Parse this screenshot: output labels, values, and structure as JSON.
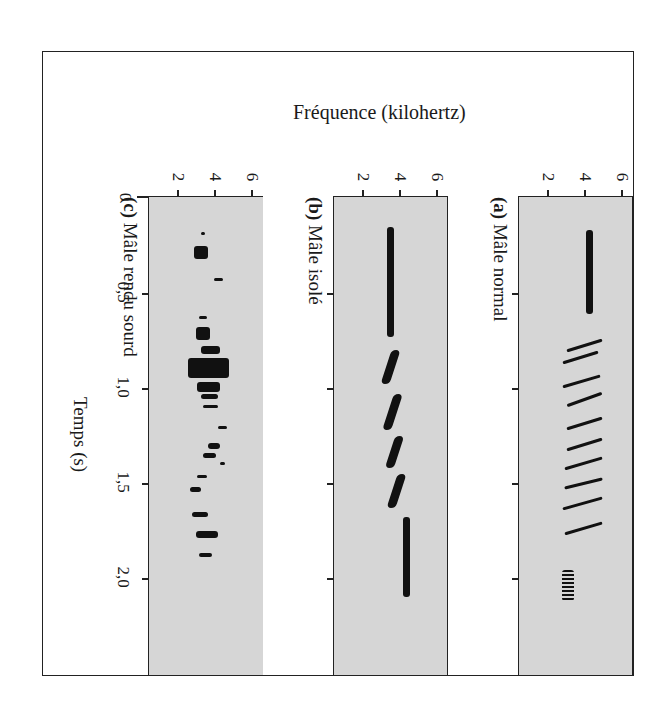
{
  "figure": {
    "frequency_label": "Fréquence (kilohertz)",
    "time_label": "Temps (s)",
    "panel_background": "#d6d6d6",
    "mark_color": "#111111"
  },
  "chart_data": {
    "type": "heatmap",
    "subtype": "spectrogram (rotated 90° clockwise: time runs downward, frequency runs rightward)",
    "title": "",
    "xlabel": "Temps (s)",
    "ylabel": "Fréquence (kilohertz)",
    "time_ticks": [
      "0",
      "0,5",
      "1,0",
      "1,5",
      "2,0"
    ],
    "time_tick_values": [
      0,
      0.5,
      1.0,
      1.5,
      2.0
    ],
    "frequency_ticks": [
      "2",
      "4",
      "6"
    ],
    "frequency_tick_values": [
      2,
      4,
      6
    ],
    "xlim": [
      0,
      2.5
    ],
    "ylim": [
      0,
      7
    ],
    "grid": false,
    "panels": [
      {
        "id": "c",
        "label_letter": "(c)",
        "label_text": "Mâle rendu sourd",
        "description": "Scattered, irregular fragments around 3–4 kHz with no coherent structure",
        "segments": [
          {
            "t0": 0.18,
            "t1": 0.19,
            "f0": 3.3,
            "f1": 3.5
          },
          {
            "t0": 0.25,
            "t1": 0.32,
            "f0": 2.9,
            "f1": 3.7
          },
          {
            "t0": 0.42,
            "t1": 0.43,
            "f0": 4.0,
            "f1": 4.5
          },
          {
            "t0": 0.62,
            "t1": 0.63,
            "f0": 3.2,
            "f1": 3.6
          },
          {
            "t0": 0.68,
            "t1": 0.75,
            "f0": 3.0,
            "f1": 3.8
          },
          {
            "t0": 0.78,
            "t1": 0.82,
            "f0": 3.3,
            "f1": 4.3
          },
          {
            "t0": 0.84,
            "t1": 0.95,
            "f0": 2.6,
            "f1": 4.8
          },
          {
            "t0": 0.97,
            "t1": 1.02,
            "f0": 3.1,
            "f1": 4.3
          },
          {
            "t0": 1.03,
            "t1": 1.06,
            "f0": 3.3,
            "f1": 4.2
          },
          {
            "t0": 1.09,
            "t1": 1.1,
            "f0": 3.4,
            "f1": 4.2
          },
          {
            "t0": 1.2,
            "t1": 1.21,
            "f0": 4.2,
            "f1": 4.7
          },
          {
            "t0": 1.29,
            "t1": 1.32,
            "f0": 3.7,
            "f1": 4.3
          },
          {
            "t0": 1.34,
            "t1": 1.37,
            "f0": 3.4,
            "f1": 4.1
          },
          {
            "t0": 1.39,
            "t1": 1.4,
            "f0": 4.3,
            "f1": 4.6
          },
          {
            "t0": 1.46,
            "t1": 1.47,
            "f0": 3.1,
            "f1": 3.6
          },
          {
            "t0": 1.52,
            "t1": 1.55,
            "f0": 2.7,
            "f1": 3.3
          },
          {
            "t0": 1.65,
            "t1": 1.68,
            "f0": 2.8,
            "f1": 3.7
          },
          {
            "t0": 1.75,
            "t1": 1.79,
            "f0": 3.0,
            "f1": 4.2
          },
          {
            "t0": 1.87,
            "t1": 1.89,
            "f0": 3.2,
            "f1": 3.9
          }
        ]
      },
      {
        "id": "b",
        "label_letter": "(b)",
        "label_text": "Mâle isolé",
        "description": "Long flat tone (~3.7 kHz), four wavy notes (~3.3–4.0 kHz), then long tone (~4.5 kHz)",
        "segments": [
          {
            "t0": 0.15,
            "t1": 0.73,
            "f0": 3.3,
            "f1": 3.8,
            "shape": "tone"
          },
          {
            "t0": 0.8,
            "t1": 0.98,
            "f0": 3.1,
            "f1": 4.0,
            "shape": "note"
          },
          {
            "t0": 1.03,
            "t1": 1.22,
            "f0": 3.2,
            "f1": 4.1,
            "shape": "note"
          },
          {
            "t0": 1.25,
            "t1": 1.42,
            "f0": 3.3,
            "f1": 4.2,
            "shape": "note"
          },
          {
            "t0": 1.45,
            "t1": 1.63,
            "f0": 3.4,
            "f1": 4.3,
            "shape": "note"
          },
          {
            "t0": 1.68,
            "t1": 2.1,
            "f0": 4.1,
            "f1": 4.7,
            "shape": "tone"
          }
        ]
      },
      {
        "id": "a",
        "label_letter": "(a)",
        "label_text": "Mâle normal",
        "description": "Introductory whistle (~4.3 kHz), series of ~11 descending trill notes (~3–5 kHz), terminal buzz (~3.5 kHz)",
        "segments": [
          {
            "t0": 0.17,
            "t1": 0.61,
            "f0": 4.0,
            "f1": 4.6,
            "shape": "tone"
          },
          {
            "t0": 0.74,
            "t1": 0.8,
            "f0": 3.0,
            "f1": 5.0,
            "shape": "sweep"
          },
          {
            "t0": 0.8,
            "t1": 0.86,
            "f0": 2.8,
            "f1": 4.8,
            "shape": "sweep"
          },
          {
            "t0": 0.93,
            "t1": 0.99,
            "f0": 2.8,
            "f1": 4.9,
            "shape": "sweep"
          },
          {
            "t0": 1.02,
            "t1": 1.09,
            "f0": 3.0,
            "f1": 5.0,
            "shape": "sweep"
          },
          {
            "t0": 1.15,
            "t1": 1.21,
            "f0": 3.0,
            "f1": 5.0,
            "shape": "sweep"
          },
          {
            "t0": 1.26,
            "t1": 1.32,
            "f0": 3.0,
            "f1": 5.0,
            "shape": "sweep"
          },
          {
            "t0": 1.36,
            "t1": 1.42,
            "f0": 2.9,
            "f1": 5.0,
            "shape": "sweep"
          },
          {
            "t0": 1.47,
            "t1": 1.52,
            "f0": 2.9,
            "f1": 5.0,
            "shape": "sweep"
          },
          {
            "t0": 1.57,
            "t1": 1.63,
            "f0": 2.8,
            "f1": 5.0,
            "shape": "sweep"
          },
          {
            "t0": 1.7,
            "t1": 1.76,
            "f0": 2.9,
            "f1": 5.0,
            "shape": "sweep"
          },
          {
            "t0": 1.96,
            "t1": 2.12,
            "f0": 2.8,
            "f1": 3.8,
            "shape": "buzz"
          }
        ]
      }
    ]
  }
}
